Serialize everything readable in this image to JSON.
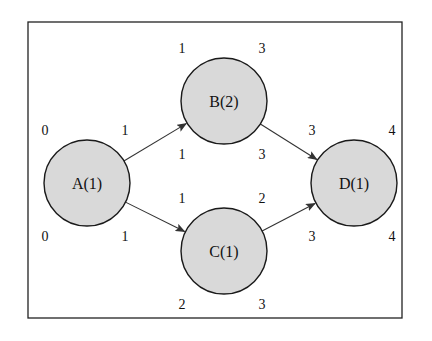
{
  "diagram": {
    "type": "network-schedule",
    "frame": {
      "x": 28,
      "y": 22,
      "w": 374,
      "h": 296
    },
    "node_fill": "#d9d9d9",
    "node_stroke": "#1a1a1a",
    "nodes": [
      {
        "id": "A",
        "label": "A(1)",
        "cx": 87,
        "cy": 183,
        "r": 43,
        "es": "0",
        "ef": "1",
        "ls": "0",
        "lf": "1"
      },
      {
        "id": "B",
        "label": "B(2)",
        "cx": 224,
        "cy": 101,
        "r": 43,
        "es": "1",
        "ef": "3",
        "ls": "1",
        "lf": "3"
      },
      {
        "id": "C",
        "label": "C(1)",
        "cx": 224,
        "cy": 251,
        "r": 43,
        "es": "1",
        "ef": "2",
        "ls": "2",
        "lf": "3"
      },
      {
        "id": "D",
        "label": "D(1)",
        "cx": 354,
        "cy": 183,
        "r": 43,
        "es": "3",
        "ef": "4",
        "ls": "3",
        "lf": "4"
      }
    ],
    "edges": [
      {
        "from": "A",
        "to": "B"
      },
      {
        "from": "A",
        "to": "C"
      },
      {
        "from": "B",
        "to": "D"
      },
      {
        "from": "C",
        "to": "D"
      }
    ]
  }
}
